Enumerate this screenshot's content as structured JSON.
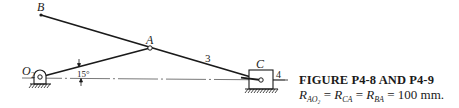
{
  "figure": {
    "title": "FIGURE P4-8 AND P4-9",
    "equation": {
      "terms": [
        {
          "symbol": "R",
          "subscript": "AO₂"
        },
        {
          "symbol": "R",
          "subscript": "CA"
        },
        {
          "symbol": "R",
          "subscript": "BA"
        }
      ],
      "equals": "=",
      "value": "100 mm."
    }
  },
  "diagram": {
    "points": {
      "B": {
        "label": "B",
        "x": 41,
        "y": 15
      },
      "A": {
        "label": "A",
        "x": 150,
        "y": 48
      },
      "O2": {
        "label": "O",
        "subscript": "2",
        "x": 40,
        "y": 77
      },
      "C": {
        "label": "C",
        "x": 261,
        "y": 80
      }
    },
    "link_labels": {
      "link3": "3",
      "link4": "4"
    },
    "angle": {
      "label": "15°",
      "value_deg": 15
    },
    "colors": {
      "line": "#1a1a1a",
      "centerline": "#555555",
      "background": "#ffffff"
    }
  }
}
